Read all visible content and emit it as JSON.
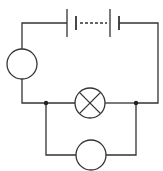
{
  "diagram": {
    "type": "electric-circuit",
    "stroke_color": "#333333",
    "background": "#ffffff",
    "components": [
      {
        "id": "battery",
        "kind": "battery-of-cells",
        "label": "",
        "position": "top"
      },
      {
        "id": "meter-left",
        "kind": "meter-circle",
        "label": "",
        "position": "left"
      },
      {
        "id": "lamp",
        "kind": "lamp",
        "label": "",
        "position": "middle"
      },
      {
        "id": "meter-bottom",
        "kind": "meter-circle",
        "label": "",
        "position": "bottom-parallel"
      }
    ],
    "junctions": [
      {
        "id": "junction-left"
      },
      {
        "id": "junction-right"
      }
    ]
  }
}
